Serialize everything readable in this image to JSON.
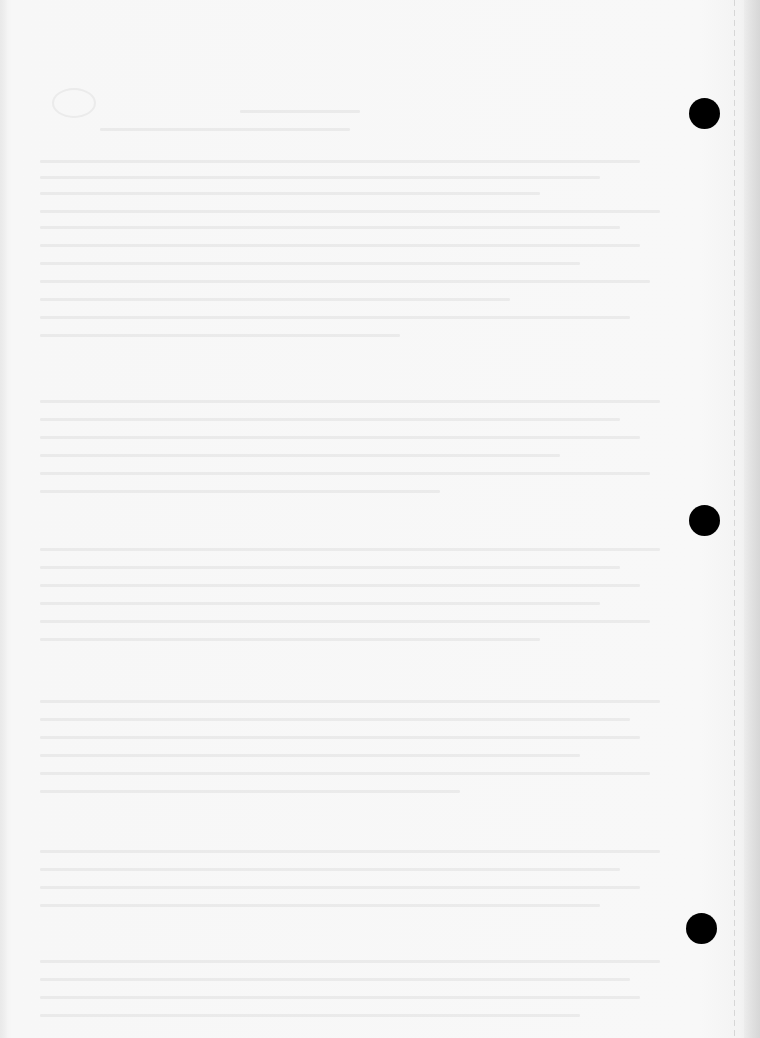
{
  "document": {
    "type": "scanned blank page",
    "legible_text": "",
    "background_color": "#f6f6f6",
    "punch_holes": [
      {
        "cx": 704,
        "cy": 113,
        "r": 15
      },
      {
        "cx": 704,
        "cy": 520,
        "r": 15
      },
      {
        "cx": 701,
        "cy": 928,
        "r": 15
      }
    ],
    "hole_color": "#000000"
  }
}
